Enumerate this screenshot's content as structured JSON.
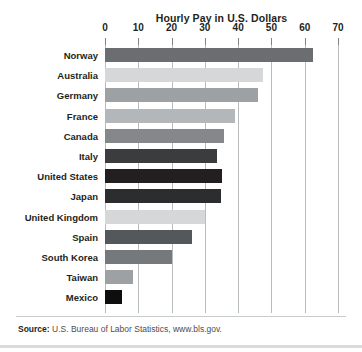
{
  "chart_data": {
    "type": "bar",
    "orientation": "horizontal",
    "title": "Hourly Pay in U.S. Dollars",
    "xlabel": "",
    "ylabel": "",
    "xlim": [
      0,
      70
    ],
    "grid": true,
    "legend": "none",
    "tick_labels": [
      "0",
      "10",
      "20",
      "30",
      "40",
      "50",
      "60",
      "70"
    ],
    "ticks": [
      0,
      10,
      20,
      30,
      40,
      50,
      60,
      70
    ],
    "categories": [
      "Norway",
      "Australia",
      "Germany",
      "France",
      "Canada",
      "Italy",
      "United States",
      "Japan",
      "United Kingdom",
      "Spain",
      "South Korea",
      "Taiwan",
      "Mexico"
    ],
    "values": [
      62.5,
      47.5,
      46,
      39,
      35.7,
      33.6,
      35.2,
      34.8,
      30,
      26,
      20,
      8.5,
      5
    ],
    "bar_colors": [
      "#6b6e70",
      "#d5d7d8",
      "#9ea1a3",
      "#b4b7b9",
      "#85888a",
      "#3b3c3e",
      "#231f20",
      "#2c2d2f",
      "#d5d7d8",
      "#55585a",
      "#76797b",
      "#9ea1a3",
      "#0e0e0f"
    ],
    "annotations": {
      "source_label": "Source:",
      "source_text": "U.S. Bureau of Labor Statistics, www.bls.gov."
    },
    "colors": {
      "gridline": "#b9bcbe",
      "text": "#231f20",
      "footer_rule": "#d9dcdd",
      "background": "#ffffff"
    }
  }
}
